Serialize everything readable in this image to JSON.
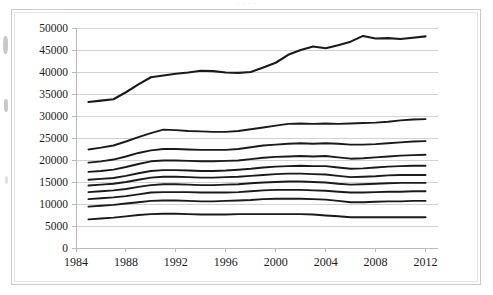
{
  "figure": {
    "title_remnant": "·      ·            ·                      ·",
    "background_color": "#ffffff",
    "frame_color": "#c9c9cf",
    "line_color": "#1a1a1a",
    "gridline_color": "#d2d2d6"
  },
  "axis": {
    "y_ticks": [
      "0",
      "5000",
      "10000",
      "15000",
      "20000",
      "25000",
      "30000",
      "35000",
      "40000",
      "45000",
      "50000"
    ],
    "x_ticks": [
      "1984",
      "1988",
      "1992",
      "1996",
      "2000",
      "2004",
      "2008",
      "2012"
    ]
  },
  "chart_data": {
    "type": "line",
    "title": "",
    "subtitle": "",
    "xlabel": "",
    "ylabel": "",
    "xlim": [
      1984,
      2013
    ],
    "ylim": [
      0,
      50000
    ],
    "grid": true,
    "legend": "none",
    "x": [
      1985,
      1986,
      1987,
      1988,
      1989,
      1990,
      1991,
      1992,
      1993,
      1994,
      1995,
      1996,
      1997,
      1998,
      1999,
      2000,
      2001,
      2002,
      2003,
      2004,
      2005,
      2006,
      2007,
      2008,
      2009,
      2010,
      2011,
      2012
    ],
    "series": [
      {
        "name": "Top line",
        "values": [
          33200,
          33500,
          33800,
          35400,
          37200,
          38800,
          39200,
          39600,
          39900,
          40300,
          40200,
          39900,
          39800,
          40000,
          41000,
          42100,
          43900,
          45000,
          45800,
          45400,
          46100,
          46900,
          48200,
          47600,
          47700,
          47500,
          47800,
          48100
        ]
      },
      {
        "name": "Line 2",
        "values": [
          22400,
          22800,
          23300,
          24200,
          25200,
          26100,
          26900,
          26800,
          26600,
          26500,
          26400,
          26400,
          26600,
          27000,
          27400,
          27800,
          28200,
          28300,
          28200,
          28300,
          28200,
          28300,
          28400,
          28500,
          28700,
          29000,
          29200,
          29300
        ]
      },
      {
        "name": "Line 3",
        "values": [
          19400,
          19700,
          20100,
          20800,
          21600,
          22200,
          22500,
          22500,
          22400,
          22300,
          22300,
          22300,
          22500,
          22900,
          23300,
          23500,
          23700,
          23800,
          23700,
          23800,
          23700,
          23500,
          23500,
          23600,
          23800,
          24000,
          24200,
          24300
        ]
      },
      {
        "name": "Line 4",
        "values": [
          17300,
          17500,
          17800,
          18400,
          19100,
          19700,
          19900,
          19900,
          19800,
          19700,
          19700,
          19800,
          19900,
          20200,
          20500,
          20700,
          20800,
          20900,
          20800,
          20900,
          20600,
          20300,
          20400,
          20600,
          20800,
          21000,
          21100,
          21200
        ]
      },
      {
        "name": "Line 5",
        "values": [
          15500,
          15700,
          15900,
          16400,
          17000,
          17500,
          17700,
          17700,
          17600,
          17500,
          17500,
          17600,
          17800,
          18000,
          18300,
          18500,
          18600,
          18700,
          18600,
          18600,
          18300,
          18000,
          18100,
          18300,
          18500,
          18600,
          18700,
          18700
        ]
      },
      {
        "name": "Line 6",
        "values": [
          14200,
          14400,
          14600,
          15000,
          15500,
          16000,
          16200,
          16200,
          16100,
          16000,
          16000,
          16100,
          16200,
          16400,
          16600,
          16800,
          16900,
          16900,
          16800,
          16700,
          16400,
          16100,
          16200,
          16300,
          16500,
          16600,
          16600,
          16600
        ]
      },
      {
        "name": "Line 7",
        "values": [
          12700,
          12900,
          13100,
          13400,
          13900,
          14300,
          14500,
          14500,
          14400,
          14300,
          14300,
          14400,
          14500,
          14700,
          14900,
          15000,
          15100,
          15100,
          15000,
          14900,
          14600,
          14400,
          14500,
          14600,
          14700,
          14800,
          14800,
          14800
        ]
      },
      {
        "name": "Line 8",
        "values": [
          11100,
          11300,
          11500,
          11800,
          12200,
          12600,
          12700,
          12700,
          12700,
          12600,
          12600,
          12600,
          12700,
          12900,
          13100,
          13200,
          13200,
          13200,
          13100,
          13000,
          12800,
          12600,
          12600,
          12700,
          12800,
          12800,
          12900,
          12900
        ]
      },
      {
        "name": "Line 9",
        "values": [
          9400,
          9600,
          9800,
          10100,
          10400,
          10700,
          10800,
          10800,
          10700,
          10600,
          10600,
          10700,
          10800,
          10900,
          11100,
          11200,
          11200,
          11200,
          11100,
          11000,
          10700,
          10400,
          10400,
          10500,
          10600,
          10600,
          10700,
          10700
        ]
      },
      {
        "name": "Line 10",
        "values": [
          6500,
          6700,
          6900,
          7200,
          7500,
          7700,
          7800,
          7800,
          7700,
          7600,
          7600,
          7600,
          7700,
          7700,
          7700,
          7700,
          7700,
          7700,
          7600,
          7400,
          7200,
          7000,
          7000,
          7000,
          7000,
          7000,
          7000,
          7000
        ]
      }
    ]
  }
}
